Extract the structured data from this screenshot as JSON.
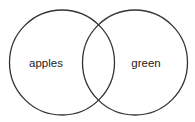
{
  "diagram": {
    "type": "venn",
    "sets": [
      {
        "label": "apples",
        "cx": 62,
        "cy": 62,
        "r": 52
      },
      {
        "label": "green",
        "cx": 135,
        "cy": 62,
        "r": 52
      }
    ],
    "stroke_color": "#333333",
    "background": "#ffffff"
  }
}
